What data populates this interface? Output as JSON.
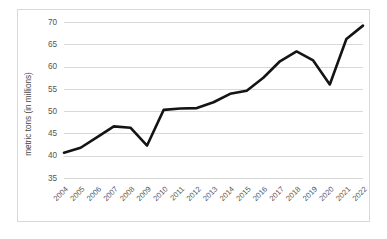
{
  "chart_data": {
    "type": "line",
    "title": "",
    "xlabel": "",
    "ylabel": "metric tons (in millions)",
    "ylim": [
      35,
      70
    ],
    "yticks": [
      35,
      40,
      45,
      50,
      55,
      60,
      65,
      70
    ],
    "ytick_labels": [
      "35",
      "40",
      "45",
      "50",
      "55",
      "60",
      "65",
      "70"
    ],
    "grid": "horizontal",
    "legend": "none",
    "line_color": "#141414",
    "gridline_color": "#d4d4d4",
    "categories": [
      "2004",
      "2005",
      "2006",
      "2007",
      "2008",
      "2009",
      "2010",
      "2011",
      "2012",
      "2013",
      "2014",
      "2015",
      "2016",
      "2017",
      "2018",
      "2019",
      "2020",
      "2021",
      "2022"
    ],
    "values": [
      40.8,
      41.9,
      44.3,
      46.7,
      46.4,
      42.4,
      50.4,
      50.7,
      50.8,
      52.1,
      54.0,
      54.7,
      57.6,
      61.3,
      63.5,
      61.5,
      56.1,
      66.3,
      69.3
    ],
    "series": [
      {
        "name": "metric tons (in millions)",
        "values": [
          40.8,
          41.9,
          44.3,
          46.7,
          46.4,
          42.4,
          50.4,
          50.7,
          50.8,
          52.1,
          54.0,
          54.7,
          57.6,
          61.3,
          63.5,
          61.5,
          56.1,
          66.3,
          69.3
        ]
      }
    ]
  }
}
